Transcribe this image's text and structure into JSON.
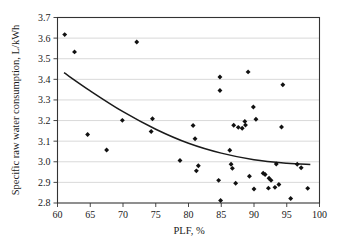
{
  "chart_data": {
    "type": "scatter",
    "title": "",
    "xlabel": "PLF, %",
    "ylabel": "Specific raw water consumption, L/kWh",
    "xlim": [
      60,
      100
    ],
    "ylim": [
      2.8,
      3.7
    ],
    "xticks": [
      60,
      65,
      70,
      75,
      80,
      85,
      90,
      95,
      100
    ],
    "yticks": [
      2.8,
      2.9,
      3.0,
      3.1,
      3.2,
      3.3,
      3.4,
      3.5,
      3.6,
      3.7
    ],
    "xtick_labels": [
      "60",
      "65",
      "70",
      "75",
      "80",
      "85",
      "90",
      "95",
      "100"
    ],
    "ytick_labels": [
      "2.8",
      "2.9",
      "3.0",
      "3.1",
      "3.2",
      "3.3",
      "3.4",
      "3.5",
      "3.6",
      "3.7"
    ],
    "grid": "horizontal",
    "legend": "none",
    "marker": "filled-diamond",
    "marker_color": "#111111",
    "points": [
      {
        "x": 61.1,
        "y": 3.617
      },
      {
        "x": 62.6,
        "y": 3.533
      },
      {
        "x": 64.6,
        "y": 3.132
      },
      {
        "x": 67.5,
        "y": 3.057
      },
      {
        "x": 69.9,
        "y": 3.201
      },
      {
        "x": 72.1,
        "y": 3.581
      },
      {
        "x": 74.3,
        "y": 3.147
      },
      {
        "x": 74.5,
        "y": 3.209
      },
      {
        "x": 78.7,
        "y": 3.006
      },
      {
        "x": 80.7,
        "y": 3.176
      },
      {
        "x": 81.0,
        "y": 3.112
      },
      {
        "x": 81.2,
        "y": 2.956
      },
      {
        "x": 81.5,
        "y": 2.981
      },
      {
        "x": 84.6,
        "y": 2.91
      },
      {
        "x": 84.8,
        "y": 3.411
      },
      {
        "x": 84.8,
        "y": 3.346
      },
      {
        "x": 84.9,
        "y": 2.812
      },
      {
        "x": 86.3,
        "y": 3.056
      },
      {
        "x": 86.5,
        "y": 2.988
      },
      {
        "x": 86.7,
        "y": 2.968
      },
      {
        "x": 86.9,
        "y": 3.177
      },
      {
        "x": 87.2,
        "y": 2.896
      },
      {
        "x": 87.6,
        "y": 3.167
      },
      {
        "x": 88.2,
        "y": 3.163
      },
      {
        "x": 88.6,
        "y": 3.196
      },
      {
        "x": 88.7,
        "y": 3.178
      },
      {
        "x": 89.1,
        "y": 3.436
      },
      {
        "x": 89.3,
        "y": 2.93
      },
      {
        "x": 89.9,
        "y": 3.266
      },
      {
        "x": 90.0,
        "y": 2.868
      },
      {
        "x": 90.3,
        "y": 3.206
      },
      {
        "x": 91.4,
        "y": 2.944
      },
      {
        "x": 91.7,
        "y": 2.938
      },
      {
        "x": 92.2,
        "y": 2.872
      },
      {
        "x": 92.3,
        "y": 2.92
      },
      {
        "x": 92.6,
        "y": 2.91
      },
      {
        "x": 93.2,
        "y": 2.876
      },
      {
        "x": 93.4,
        "y": 2.989
      },
      {
        "x": 93.8,
        "y": 2.89
      },
      {
        "x": 94.2,
        "y": 3.169
      },
      {
        "x": 94.4,
        "y": 3.374
      },
      {
        "x": 95.6,
        "y": 2.822
      },
      {
        "x": 96.6,
        "y": 2.988
      },
      {
        "x": 97.2,
        "y": 2.971
      },
      {
        "x": 98.2,
        "y": 2.871
      }
    ],
    "trendline": {
      "type": "power-fit",
      "color": "#1a1a1a",
      "x_start": 61.0,
      "x_end": 98.6,
      "points": [
        {
          "x": 61.0,
          "y": 3.432
        },
        {
          "x": 65.0,
          "y": 3.344
        },
        {
          "x": 70.0,
          "y": 3.243
        },
        {
          "x": 75.0,
          "y": 3.158
        },
        {
          "x": 80.0,
          "y": 3.09
        },
        {
          "x": 85.0,
          "y": 3.042
        },
        {
          "x": 90.0,
          "y": 3.01
        },
        {
          "x": 95.0,
          "y": 2.993
        },
        {
          "x": 98.6,
          "y": 2.987
        }
      ]
    }
  }
}
